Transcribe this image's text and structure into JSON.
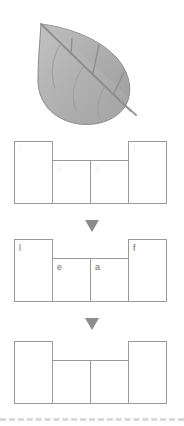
{
  "page": {
    "background_color": "#ffffff",
    "width": 184,
    "height": 426
  },
  "illustration": {
    "name": "leaf-illustration",
    "alt_text": "leaf",
    "body_fill": "#b0b0b0",
    "outline_color": "#8a8a8a",
    "vein_color": "#8e8e8e"
  },
  "word": "leaf",
  "letters": [
    "l",
    "e",
    "a",
    "f"
  ],
  "diagrams": [
    {
      "id": "boxes-filled-ghost",
      "label": "leaf-boxes-ghost",
      "cells": [
        {
          "letter": "l",
          "height": "tall",
          "visible": false
        },
        {
          "letter": "e",
          "height": "short",
          "visible": false
        },
        {
          "letter": "a",
          "height": "short",
          "visible": false
        },
        {
          "letter": "f",
          "height": "tall",
          "visible": false
        }
      ]
    },
    {
      "id": "boxes-filled",
      "label": "leaf-boxes-filled",
      "cells": [
        {
          "letter": "l",
          "height": "tall",
          "visible": true
        },
        {
          "letter": "e",
          "height": "short",
          "visible": true
        },
        {
          "letter": "a",
          "height": "short",
          "visible": true
        },
        {
          "letter": "f",
          "height": "tall",
          "visible": true
        }
      ]
    },
    {
      "id": "boxes-empty",
      "label": "leaf-boxes-empty",
      "cells": [
        {
          "letter": "",
          "height": "tall",
          "visible": false
        },
        {
          "letter": "",
          "height": "short",
          "visible": false
        },
        {
          "letter": "",
          "height": "short",
          "visible": false
        },
        {
          "letter": "",
          "height": "tall",
          "visible": false
        }
      ]
    }
  ],
  "arrows": [
    {
      "name": "arrow-down-1",
      "glyph": "triangle-down",
      "color": "#8c8c8c"
    },
    {
      "name": "arrow-down-2",
      "glyph": "triangle-down",
      "color": "#8c8c8c"
    }
  ],
  "divider": {
    "name": "bottom-dashed-rule",
    "style": "dashed",
    "color": "#d9d9d9"
  },
  "colors": {
    "box_stroke": "#9a9a9a",
    "letter": "#6e6e6e",
    "letter_ghost": "#f0f0f0",
    "arrow": "#8c8c8c",
    "dash": "#d9d9d9"
  }
}
